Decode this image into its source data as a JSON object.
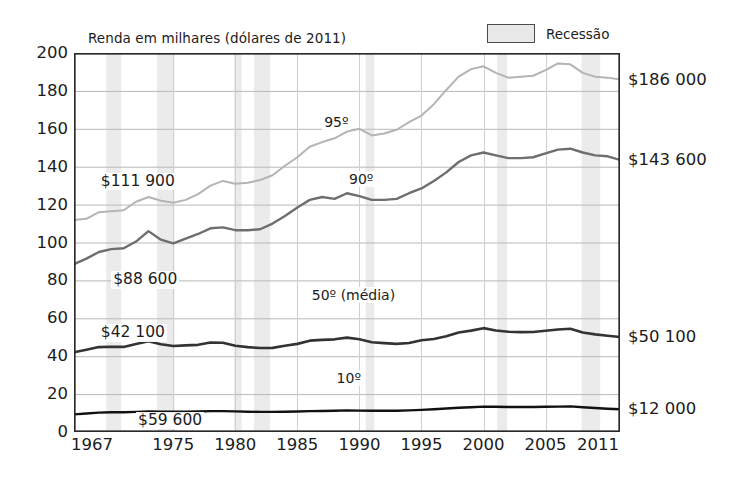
{
  "chart_data": {
    "type": "line",
    "title": "Renda em milhares (dólares de 2011)",
    "xlabel": "",
    "ylabel": "",
    "xlim": [
      1967,
      2011
    ],
    "ylim": [
      0,
      200
    ],
    "y_ticks": [
      0,
      20,
      40,
      60,
      80,
      100,
      120,
      140,
      160,
      180,
      200
    ],
    "x_ticks": [
      1967,
      1975,
      1980,
      1985,
      1990,
      1995,
      2000,
      2005,
      2011
    ],
    "x_tick_labels": [
      "1967",
      "1975",
      "1980",
      "1985",
      "1990",
      "1995",
      "2000",
      "2005",
      "2011"
    ],
    "y_tick_labels": [
      "0",
      "20",
      "40",
      "60",
      "80",
      "100",
      "120",
      "140",
      "160",
      "180",
      "200"
    ],
    "grid": true,
    "legend_position": "top-right",
    "legend": [
      {
        "label": "Recessão",
        "swatch": "#e8e8e8",
        "border": "#4a4a4a"
      }
    ],
    "series": [
      {
        "name": "95º",
        "label": "95º",
        "color": "#b4b4b4",
        "width": 2.0,
        "start_value_label": "$111 900",
        "end_value_label": "$186 000",
        "x": [
          1967,
          1968,
          1969,
          1970,
          1971,
          1972,
          1973,
          1974,
          1975,
          1976,
          1977,
          1978,
          1979,
          1980,
          1981,
          1982,
          1983,
          1984,
          1985,
          1986,
          1987,
          1988,
          1989,
          1990,
          1991,
          1992,
          1993,
          1994,
          1995,
          1996,
          1997,
          1998,
          1999,
          2000,
          2001,
          2002,
          2003,
          2004,
          2005,
          2006,
          2007,
          2008,
          2009,
          2010,
          2011
        ],
        "values": [
          111.9,
          112.5,
          116.0,
          116.5,
          117.0,
          121.5,
          124.0,
          122.0,
          121.0,
          122.5,
          125.5,
          130.0,
          132.5,
          131.0,
          131.5,
          133.0,
          135.5,
          140.5,
          145.0,
          150.5,
          153.0,
          155.0,
          158.5,
          160.0,
          156.5,
          157.5,
          159.5,
          163.5,
          167.0,
          173.0,
          180.5,
          187.5,
          191.5,
          193.0,
          189.5,
          187.0,
          187.5,
          188.0,
          191.0,
          194.5,
          194.0,
          189.5,
          187.5,
          187.0,
          186.0
        ]
      },
      {
        "name": "90º",
        "label": "90º",
        "color": "#6e6e6e",
        "width": 2.4,
        "start_value_label": "$88 600",
        "end_value_label": "$143 600",
        "x": [
          1967,
          1968,
          1969,
          1970,
          1971,
          1972,
          1973,
          1974,
          1975,
          1976,
          1977,
          1978,
          1979,
          1980,
          1981,
          1982,
          1983,
          1984,
          1985,
          1986,
          1987,
          1988,
          1989,
          1990,
          1991,
          1992,
          1993,
          1994,
          1995,
          1996,
          1997,
          1998,
          1999,
          2000,
          2001,
          2002,
          2003,
          2004,
          2005,
          2006,
          2007,
          2008,
          2009,
          2010,
          2011
        ],
        "values": [
          88.6,
          91.5,
          95.0,
          96.5,
          97.0,
          100.5,
          106.0,
          101.5,
          99.5,
          102.0,
          104.5,
          107.5,
          108.0,
          106.5,
          106.5,
          107.0,
          110.0,
          114.0,
          118.5,
          122.5,
          124.0,
          123.0,
          126.0,
          124.5,
          122.5,
          122.5,
          123.0,
          126.0,
          128.5,
          132.5,
          137.0,
          142.5,
          146.0,
          147.5,
          146.0,
          144.5,
          144.5,
          145.0,
          147.0,
          149.0,
          149.5,
          147.5,
          146.0,
          145.5,
          143.6
        ]
      },
      {
        "name": "50º (média)",
        "label": "50º (média)",
        "color": "#333333",
        "width": 2.6,
        "start_value_label": "$42 100",
        "end_value_label": "$50 100",
        "x": [
          1967,
          1968,
          1969,
          1970,
          1971,
          1972,
          1973,
          1974,
          1975,
          1976,
          1977,
          1978,
          1979,
          1980,
          1981,
          1982,
          1983,
          1984,
          1985,
          1986,
          1987,
          1988,
          1989,
          1990,
          1991,
          1992,
          1993,
          1994,
          1995,
          1996,
          1997,
          1998,
          1999,
          2000,
          2001,
          2002,
          2003,
          2004,
          2005,
          2006,
          2007,
          2008,
          2009,
          2010,
          2011
        ],
        "values": [
          42.1,
          43.4,
          44.8,
          45.0,
          44.9,
          46.4,
          47.9,
          46.3,
          45.4,
          45.7,
          46.0,
          47.2,
          47.1,
          45.5,
          44.8,
          44.3,
          44.4,
          45.5,
          46.5,
          48.2,
          48.6,
          48.9,
          49.8,
          48.9,
          47.4,
          46.9,
          46.5,
          47.0,
          48.4,
          49.1,
          50.5,
          52.5,
          53.5,
          54.8,
          53.6,
          52.9,
          52.7,
          52.8,
          53.4,
          54.1,
          54.5,
          52.5,
          51.5,
          50.8,
          50.1
        ]
      },
      {
        "name": "10º",
        "label": "10º",
        "color": "#111111",
        "width": 2.4,
        "start_value_label": "$59 600",
        "end_value_label": "$12 000",
        "x": [
          1967,
          1968,
          1969,
          1970,
          1971,
          1972,
          1973,
          1974,
          1975,
          1976,
          1977,
          1978,
          1979,
          1980,
          1981,
          1982,
          1983,
          1984,
          1985,
          1986,
          1987,
          1988,
          1989,
          1990,
          1991,
          1992,
          1993,
          1994,
          1995,
          1996,
          1997,
          1998,
          1999,
          2000,
          2001,
          2002,
          2003,
          2004,
          2005,
          2006,
          2007,
          2008,
          2009,
          2010,
          2011
        ],
        "values": [
          9.3,
          9.8,
          10.2,
          10.4,
          10.4,
          10.6,
          10.8,
          10.7,
          10.7,
          10.7,
          10.8,
          11.0,
          11.0,
          10.9,
          10.7,
          10.6,
          10.6,
          10.7,
          10.8,
          11.0,
          11.1,
          11.2,
          11.4,
          11.3,
          11.2,
          11.2,
          11.2,
          11.4,
          11.7,
          12.0,
          12.4,
          12.8,
          13.1,
          13.4,
          13.3,
          13.2,
          13.2,
          13.2,
          13.3,
          13.4,
          13.5,
          13.1,
          12.7,
          12.3,
          12.0
        ]
      }
    ],
    "annotations": [
      {
        "text": "95º",
        "x": 1987,
        "y": 163,
        "kind": "series-label"
      },
      {
        "text": "90º",
        "x": 1989,
        "y": 133,
        "kind": "series-label"
      },
      {
        "text": "50º (média)",
        "x": 1986,
        "y": 72,
        "kind": "series-label"
      },
      {
        "text": "10º",
        "x": 1988,
        "y": 28,
        "kind": "series-label"
      },
      {
        "text": "$111 900",
        "x": 1969,
        "y": 132,
        "kind": "value-label"
      },
      {
        "text": "$88 600",
        "x": 1970,
        "y": 80,
        "kind": "value-label"
      },
      {
        "text": "$42 100",
        "x": 1969,
        "y": 52,
        "kind": "value-label"
      },
      {
        "text": "$59 600",
        "x": 1972,
        "y": 6,
        "kind": "value-label"
      }
    ],
    "right_value_labels": [
      {
        "text": "$186 000",
        "y": 186
      },
      {
        "text": "$143 600",
        "y": 143.6
      },
      {
        "text": "$50 100",
        "y": 50.1
      },
      {
        "text": "$12 000",
        "y": 12.0
      }
    ],
    "recession_bands": [
      {
        "start": 1969.6,
        "end": 1970.8
      },
      {
        "start": 1973.7,
        "end": 1975.1
      },
      {
        "start": 1979.9,
        "end": 1980.5
      },
      {
        "start": 1981.5,
        "end": 1982.8
      },
      {
        "start": 1990.5,
        "end": 1991.2
      },
      {
        "start": 2001.1,
        "end": 2001.9
      },
      {
        "start": 2007.9,
        "end": 2009.4
      }
    ],
    "band_color": "#ebebeb",
    "grid_color": "#b9b9b9",
    "frame_color": "#2a2a2a"
  }
}
